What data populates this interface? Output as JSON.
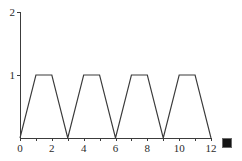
{
  "canvas": {
    "width": 242,
    "height": 161,
    "background": "#ffffff",
    "line_color": "#3a3a3a",
    "axis_color": "#3c3c3c",
    "label_color": "#2b2b2b"
  },
  "geometry": {
    "origin_x": 20,
    "origin_y": 138,
    "x_axis_end": 211,
    "y_axis_top": 12,
    "px_per_x_unit": 15.9166,
    "px_per_y_unit": 63.0
  },
  "cursor_marker": {
    "name": "selection-square",
    "left": 222,
    "top": 138,
    "size": 10,
    "color": "#141414"
  },
  "chart_data": {
    "type": "line",
    "title": "",
    "subtitle": "",
    "xlabel": "",
    "ylabel": "",
    "xlim": [
      0,
      12
    ],
    "ylim": [
      0,
      2
    ],
    "grid": false,
    "legend": null,
    "legend_position": "none",
    "x_ticks": [
      0,
      1,
      2,
      3,
      4,
      5,
      6,
      7,
      8,
      9,
      10,
      11,
      12
    ],
    "x_tick_labels": [
      {
        "value": 0,
        "label": "0"
      },
      {
        "value": 2,
        "label": "2"
      },
      {
        "value": 4,
        "label": "4"
      },
      {
        "value": 6,
        "label": "6"
      },
      {
        "value": 8,
        "label": "8"
      },
      {
        "value": 10,
        "label": "10"
      },
      {
        "value": 12,
        "label": "12"
      }
    ],
    "y_ticks": [
      1,
      2
    ],
    "y_tick_labels": [
      {
        "value": 1,
        "label": "1"
      },
      {
        "value": 2,
        "label": "2"
      }
    ],
    "series": [
      {
        "name": "trapezoidal-wave",
        "color": "#3a3a3a",
        "x": [
          0,
          1,
          2,
          3,
          4,
          5,
          6,
          7,
          8,
          9,
          10,
          11,
          12
        ],
        "y": [
          0,
          1,
          1,
          0,
          1,
          1,
          0,
          1,
          1,
          0,
          1,
          1,
          0
        ]
      }
    ]
  }
}
